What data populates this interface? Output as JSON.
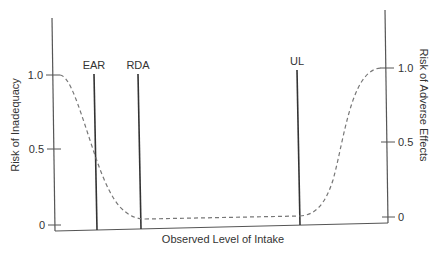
{
  "diagram": {
    "x_axis_label": "Observed Level of Intake",
    "left_axis_label": "Risk of Inadequacy",
    "right_axis_label": "Risk of Adverse Effects",
    "left_ticks": [
      "1.0",
      "0.5",
      "0"
    ],
    "right_ticks": [
      "1.0",
      "0.5",
      "0"
    ],
    "markers": [
      {
        "label": "EAR"
      },
      {
        "label": "RDA"
      },
      {
        "label": "UL"
      }
    ],
    "colors": {
      "axis": "#555555",
      "marker_line": "#333333",
      "curve": "#777777",
      "text": "#333333"
    }
  }
}
